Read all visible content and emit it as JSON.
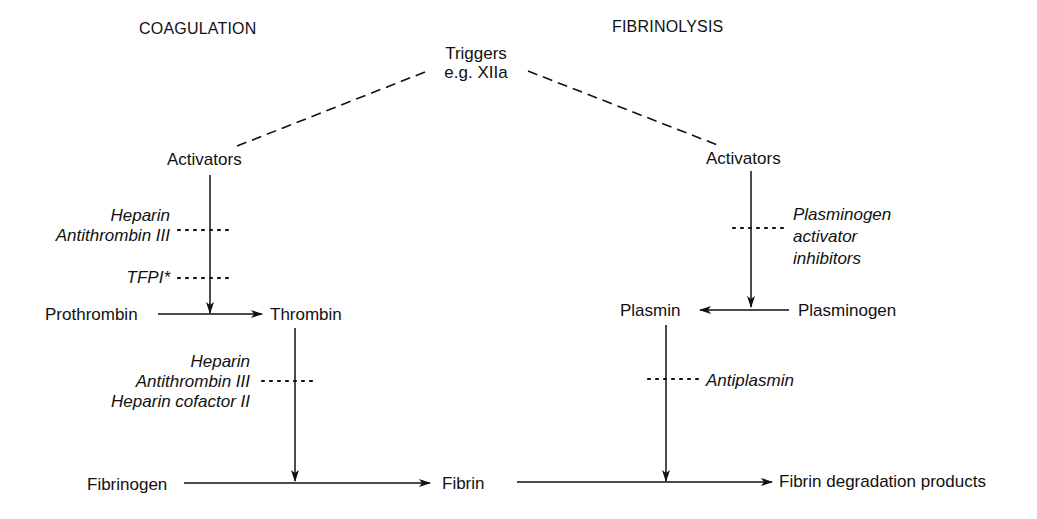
{
  "headers": {
    "coagulation": "COAGULATION",
    "fibrinolysis": "FIBRINOLYSIS"
  },
  "trigger": {
    "line1": "Triggers",
    "line2": "e.g. XIIa"
  },
  "coagulation": {
    "activators": "Activators",
    "inhibitors_1": [
      "Heparin",
      "Antithrombin III"
    ],
    "inhibitor_2": "TFPI*",
    "prothrombin": "Prothrombin",
    "thrombin": "Thrombin",
    "inhibitors_3": [
      "Heparin",
      "Antithrombin III",
      "Heparin cofactor II"
    ],
    "fibrinogen": "Fibrinogen",
    "fibrin": "Fibrin"
  },
  "fibrinolysis": {
    "activators": "Activators",
    "inhibitors_1": [
      "Plasminogen",
      "activator",
      "inhibitors"
    ],
    "plasmin": "Plasmin",
    "plasminogen": "Plasminogen",
    "inhibitor_2": "Antiplasmin",
    "products": "Fibrin degradation products"
  },
  "colors": {
    "ink": "#111111",
    "background": "#ffffff"
  }
}
